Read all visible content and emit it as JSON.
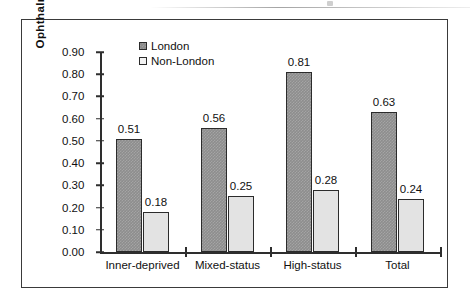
{
  "figure": {
    "background_color": "#ffffff",
    "frame_color": "#3a3a3a"
  },
  "legend": {
    "position": "top-center-left",
    "items": [
      {
        "label": "London",
        "swatch": "london-swatch",
        "color": "#8d8d8d"
      },
      {
        "label": "Non-London",
        "swatch": "non-london-swatch",
        "color": "#e3e3e3"
      }
    ]
  },
  "axes": {
    "ylabel": "Ophthalmic  medical  practitioners",
    "yticks": [
      "0.90",
      "0.80",
      "0.70",
      "0.60",
      "0.50",
      "0.40",
      "0.30",
      "0.20",
      "0.10",
      "0.00"
    ],
    "xlabels": [
      "Inner-deprived",
      "Mixed-status",
      "High-status",
      "Total"
    ]
  },
  "chart_data": {
    "type": "bar",
    "title": "",
    "subtitle": "",
    "xlabel": "",
    "ylabel": "Ophthalmic medical practitioners",
    "categories": [
      "Inner-deprived",
      "Mixed-status",
      "High-status",
      "Total"
    ],
    "series": [
      {
        "name": "London",
        "color": "#8d8d8d",
        "values": [
          0.51,
          0.56,
          0.81,
          0.63
        ]
      },
      {
        "name": "Non-London",
        "color": "#e3e3e3",
        "values": [
          0.18,
          0.25,
          0.28,
          0.24
        ]
      }
    ],
    "value_labels": [
      [
        "0.51",
        "0.18"
      ],
      [
        "0.56",
        "0.25"
      ],
      [
        "0.81",
        "0.28"
      ],
      [
        "0.63",
        "0.24"
      ]
    ],
    "ylim": [
      0.0,
      0.9
    ],
    "ytick_step": 0.1,
    "grid": false,
    "legend_position": "upper-left-inside"
  }
}
